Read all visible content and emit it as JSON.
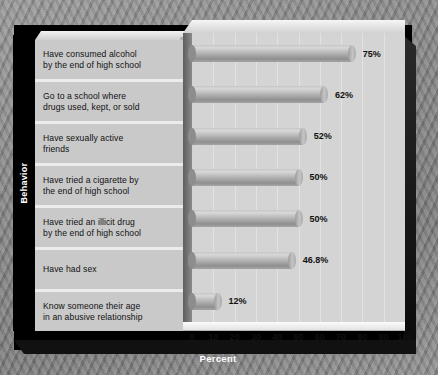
{
  "chart_data": {
    "type": "bar",
    "orientation": "horizontal",
    "title": "",
    "xlabel": "Percent",
    "ylabel": "Behavior",
    "xlim": [
      0,
      100
    ],
    "xticks": [
      "0",
      "10",
      "20",
      "30",
      "40",
      "50",
      "60",
      "70",
      "80",
      "90",
      "100"
    ],
    "grid": true,
    "legend": "none",
    "categories": [
      "Have consumed alcohol by the end of high school",
      "Go to a school where drugs used, kept, or sold",
      "Have sexually active friends",
      "Have tried a cigarette by the end of high school",
      "Have tried an illicit drug by the end of high school",
      "Have had sex",
      "Know someone their age in an abusive relationship"
    ],
    "values": [
      75,
      62,
      52,
      50,
      50,
      46.8,
      12
    ],
    "data_labels": [
      "75%",
      "62%",
      "52%",
      "50%",
      "50%",
      "46.8%",
      "12%"
    ],
    "bars": [
      {
        "label_line1": "Have consumed alcohol",
        "label_line2": "by the end of high school",
        "value": 75,
        "data_label": "75%"
      },
      {
        "label_line1": "Go to a school where",
        "label_line2": "drugs used, kept, or sold",
        "value": 62,
        "data_label": "62%"
      },
      {
        "label_line1": "Have sexually active",
        "label_line2": "friends",
        "value": 52,
        "data_label": "52%"
      },
      {
        "label_line1": "Have tried a cigarette by",
        "label_line2": "the end of high school",
        "value": 50,
        "data_label": "50%"
      },
      {
        "label_line1": "Have tried an illicit drug",
        "label_line2": "by the end of high school",
        "value": 50,
        "data_label": "50%"
      },
      {
        "label_line1": "Have had sex",
        "label_line2": "",
        "value": 46.8,
        "data_label": "46.8%"
      },
      {
        "label_line1": "Know someone their age",
        "label_line2": "in an abusive relationship",
        "value": 12,
        "data_label": "12%"
      }
    ],
    "colors": {
      "bar_fill": "#b0b0b0",
      "plot_background": "#d4d4d4",
      "gridline": "#e2e2e2",
      "label_cell": "#c9c9c9",
      "frame": "#000000",
      "axis_text": "#111111",
      "title_text": "#ffffff"
    }
  }
}
